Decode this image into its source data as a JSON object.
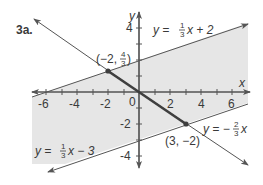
{
  "problem_label": "3a.",
  "axes": {
    "x_label": "x",
    "y_label": "y",
    "x_ticks": [
      "-6",
      "-4",
      "-2",
      "2",
      "4",
      "6"
    ],
    "y_ticks": [
      "4",
      "-2",
      "-4"
    ],
    "origin_label": "0"
  },
  "lines": [
    {
      "name": "upper-boundary",
      "equation_prefix": "y = ",
      "frac_num": "1",
      "frac_den": "3",
      "equation_suffix": "x + 2"
    },
    {
      "name": "lower-boundary",
      "equation_prefix": "y = ",
      "frac_num": "1",
      "frac_den": "3",
      "equation_suffix": "x − 3"
    },
    {
      "name": "diagonal",
      "equation_prefix": "y = −",
      "frac_num": "2",
      "frac_den": "3",
      "equation_suffix": "x"
    }
  ],
  "points": [
    {
      "name": "point-upper",
      "label_prefix": "(−2, ",
      "frac_num": "4",
      "frac_den": "3",
      "label_suffix": ")"
    },
    {
      "name": "point-lower",
      "label": "(3, −2)"
    }
  ],
  "colors": {
    "shade": "#e6e6e6",
    "line": "#555555",
    "segment": "#3f3f3f",
    "text": "#3a3a3a"
  }
}
